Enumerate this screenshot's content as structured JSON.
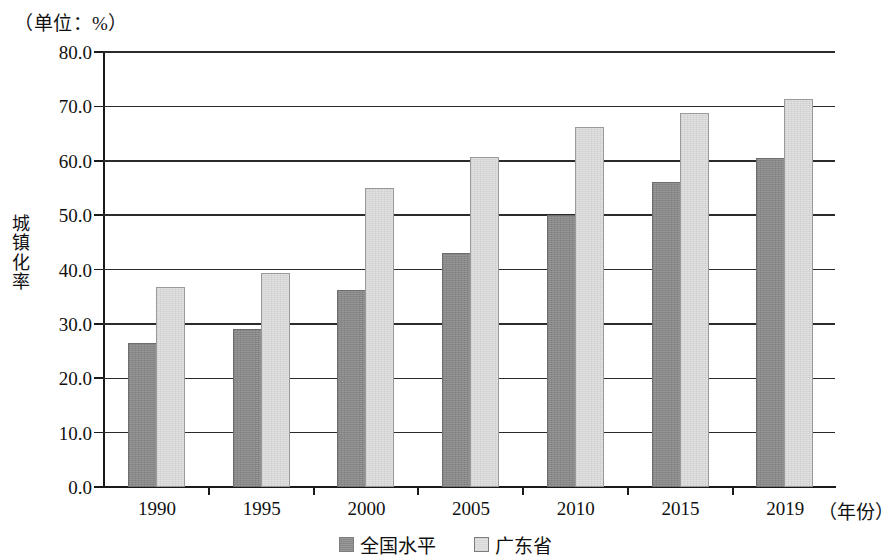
{
  "chart_data": {
    "type": "bar",
    "title": "",
    "unit_note": "（单位：%）",
    "xlabel": "（年份）",
    "ylabel": "城镇化率",
    "categories": [
      "1990",
      "1995",
      "2000",
      "2005",
      "2010",
      "2015",
      "2019"
    ],
    "series": [
      {
        "name": "全国水平",
        "color": "#888888",
        "values": [
          26.4,
          29.0,
          36.2,
          43.0,
          50.0,
          56.1,
          60.6
        ]
      },
      {
        "name": "广东省",
        "color": "#e2e2e2",
        "values": [
          36.8,
          39.4,
          55.0,
          60.7,
          66.2,
          68.7,
          71.4
        ]
      }
    ],
    "ylim": [
      0.0,
      80.0
    ],
    "ytick_labels": [
      "80.0",
      "70.0",
      "60.0",
      "50.0",
      "40.0",
      "30.0",
      "20.0",
      "10.0",
      "0.0"
    ],
    "ytick_values": [
      80.0,
      70.0,
      60.0,
      50.0,
      40.0,
      30.0,
      20.0,
      10.0,
      0.0
    ],
    "grid": true,
    "legend_position": "bottom-center"
  },
  "legend": {
    "items": [
      {
        "label": "全国水平"
      },
      {
        "label": "广东省"
      }
    ]
  },
  "y_axis_title_chars": [
    "城",
    "镇",
    "化",
    "率"
  ]
}
